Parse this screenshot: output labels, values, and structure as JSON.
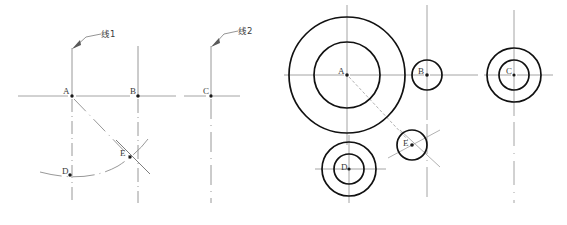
{
  "figure": {
    "background_color": "#ffffff",
    "width": 567,
    "height": 225,
    "colors": {
      "centerline": "#9a9a9a",
      "construction": "#8c8c8c",
      "outline": "#111111",
      "label": "#3a3a3a",
      "point": "#1a1a1a"
    }
  },
  "left_panel": {
    "name": "line-construction-panel",
    "annotations": [
      {
        "id": "line1",
        "text": "线1"
      },
      {
        "id": "line2",
        "text": "线2"
      }
    ],
    "points": [
      {
        "id": "A",
        "label": "A",
        "x": 72,
        "y": 96
      },
      {
        "id": "B",
        "label": "B",
        "x": 138,
        "y": 96
      },
      {
        "id": "C",
        "label": "C",
        "x": 211,
        "y": 96
      },
      {
        "id": "D",
        "label": "D",
        "x": 70,
        "y": 175
      },
      {
        "id": "E",
        "label": "E",
        "x": 127,
        "y": 155
      }
    ],
    "horizontal_axis": {
      "y": 96,
      "x_start": 18,
      "x_end": 240
    },
    "vertical_lines": [
      {
        "through": "A",
        "x": 72,
        "y_top": 48,
        "y_bottom": 203
      },
      {
        "through": "B",
        "x": 138,
        "y_top": 46,
        "y_bottom": 203
      },
      {
        "through": "C",
        "x": 211,
        "y_top": 46,
        "y_bottom": 203
      }
    ],
    "construction": {
      "chord_from": "A",
      "chord_to": "E",
      "arc_from": "D",
      "arc_to": "E",
      "tick_at": "E"
    }
  },
  "right_panel": {
    "name": "circle-layout-panel",
    "circles": [
      {
        "id": "A",
        "label": "A",
        "cx": 347,
        "cy": 75,
        "r_outer": 58,
        "r_inner": 33,
        "ring": true
      },
      {
        "id": "B",
        "label": "B",
        "cx": 427,
        "cy": 75,
        "r_outer": 15,
        "r_inner": 0,
        "ring": false
      },
      {
        "id": "C",
        "label": "C",
        "cx": 514,
        "cy": 75,
        "r_outer": 27,
        "r_inner": 15,
        "ring": true
      },
      {
        "id": "D",
        "label": "D",
        "cx": 349,
        "cy": 169,
        "r_outer": 27,
        "r_inner": 15,
        "ring": true
      },
      {
        "id": "E",
        "label": "E",
        "cx": 412,
        "cy": 145,
        "r_outer": 15,
        "r_inner": 0,
        "ring": false
      }
    ],
    "centerlines": {
      "horizontal_main": {
        "y": 75,
        "x_start": 284,
        "x_end": 553
      },
      "horizontal_lower": {
        "y": 169,
        "x_start": 315,
        "x_end": 386
      },
      "vertical_A": {
        "x": 347,
        "y_start": 5,
        "y_end": 145
      },
      "vertical_B": {
        "x": 427,
        "y_start": 5,
        "y_end": 203
      },
      "vertical_C": {
        "x": 514,
        "y_start": 10,
        "y_end": 203
      },
      "vertical_D": {
        "x": 349,
        "y_start": 135,
        "y_end": 203
      }
    },
    "construction": {
      "radius_from": "A",
      "radius_to": "E",
      "tick_at": "E"
    }
  }
}
